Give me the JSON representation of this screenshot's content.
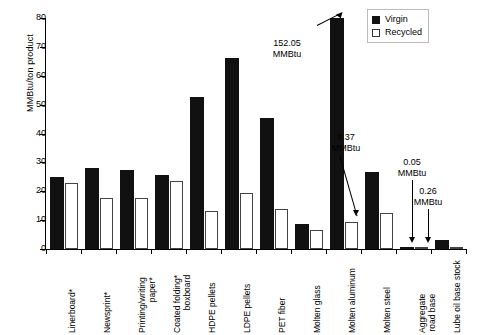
{
  "chart": {
    "type": "bar",
    "ylabel": "MMBtu/ton product",
    "xlabel": "",
    "title": "",
    "ylim": [
      0,
      80
    ],
    "yticks": [
      "0",
      "10",
      "20",
      "30",
      "40",
      "50",
      "60",
      "70",
      "80"
    ],
    "grid": false,
    "legend_position": "top-right"
  },
  "legend": {
    "items": [
      {
        "label": "Virgin",
        "color": "#111111",
        "style": "filled"
      },
      {
        "label": "Recycled",
        "color": "#ffffff",
        "style": "outlined"
      }
    ]
  },
  "chart_data": {
    "type": "bar",
    "title": "",
    "xlabel": "",
    "ylabel": "MMBtu/ton product",
    "ylim": [
      0,
      80
    ],
    "yticks": [
      0,
      10,
      20,
      30,
      40,
      50,
      60,
      70,
      80
    ],
    "grid": false,
    "legend_position": "top-right",
    "categories": [
      "Linerboard*",
      "Newsprint*",
      "Printing/writing paper*",
      "Coated folding* boxboard",
      "HDPE pellets",
      "LDPE pellets",
      "PET fiber",
      "Molten glass",
      "Molten aluminum",
      "Molten steel",
      "Aggregate road base",
      "Lube oil base stock"
    ],
    "series": [
      {
        "name": "Virgin",
        "color": "#111111",
        "values": [
          25.0,
          28.0,
          27.5,
          25.5,
          52.5,
          66.0,
          45.5,
          8.5,
          152.05,
          26.5,
          0.05,
          3.0
        ]
      },
      {
        "name": "Recycled",
        "color": "#ffffff",
        "values": [
          23.0,
          17.5,
          17.5,
          23.5,
          13.0,
          19.5,
          14.0,
          6.5,
          9.37,
          12.5,
          0.26,
          0.5
        ]
      }
    ],
    "annotations": [
      {
        "text": "152.05 MMBtu",
        "series": "Virgin",
        "category": "Molten aluminum",
        "value": 152.05
      },
      {
        "text": "9.37 MMBtu",
        "series": "Recycled",
        "category": "Molten aluminum",
        "value": 9.37
      },
      {
        "text": "0.05 MMBtu",
        "series": "Virgin",
        "category": "Aggregate road base",
        "value": 0.05
      },
      {
        "text": "0.26 MMBtu",
        "series": "Recycled",
        "category": "Aggregate road base",
        "value": 0.26
      }
    ]
  },
  "annotations": {
    "a1": {
      "num": "152.05",
      "unit": "MMBtu"
    },
    "a2": {
      "num": "9.37",
      "unit": "MMBtu"
    },
    "a3": {
      "num": "0.05",
      "unit": "MMBtu"
    },
    "a4": {
      "num": "0.26",
      "unit": "MMBtu"
    }
  },
  "categories": [
    {
      "l1": "Linerboard*",
      "l2": ""
    },
    {
      "l1": "Newsprint*",
      "l2": ""
    },
    {
      "l1": "Printing/writing",
      "l2": "paper*"
    },
    {
      "l1": "Coated folding*",
      "l2": "boxboard"
    },
    {
      "l1": "HDPE pellets",
      "l2": ""
    },
    {
      "l1": "LDPE pellets",
      "l2": ""
    },
    {
      "l1": "PET fiber",
      "l2": ""
    },
    {
      "l1": "Molten glass",
      "l2": ""
    },
    {
      "l1": "Molten aluminum",
      "l2": ""
    },
    {
      "l1": "Molten steel",
      "l2": ""
    },
    {
      "l1": "Aggregate",
      "l2": "road base"
    },
    {
      "l1": "Lube oil base stock",
      "l2": ""
    }
  ]
}
